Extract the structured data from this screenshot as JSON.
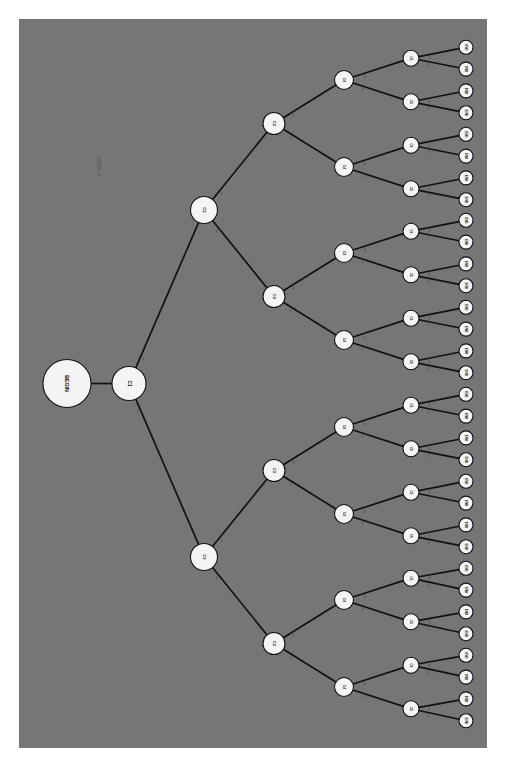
{
  "canvas": {
    "background_color": "#767676",
    "page_background_color": "#ffffff",
    "width": 468,
    "height": 729,
    "offset_x": 19,
    "offset_y": 19,
    "rotation_degrees": 90,
    "orientation_note": "all text rendered rotated 90 degrees clockwise"
  },
  "title": {
    "text": "MOD: A",
    "x": 80,
    "y": 148,
    "font_size": 5.5,
    "color": "#5e5e5e"
  },
  "style": {
    "node_fill": "#f4f4f4",
    "node_stroke": "#111111",
    "edge_stroke": "#121212",
    "label_color": "#111111",
    "edge_label_color": "#1a1a1a"
  },
  "graph": {
    "type": "binary-decision-tree",
    "root_label": "BEGIN",
    "leaf_label": "END",
    "depth_labels": [
      "BEGIN",
      "C1",
      "C2",
      "C3",
      "C4",
      "C5",
      "END"
    ],
    "leaf_count": 32,
    "edge_labels": [
      "Yes",
      "No"
    ],
    "level_radii": [
      24,
      17,
      13.5,
      11,
      9.5,
      8,
      7
    ],
    "level_font_sizes": [
      5.2,
      4.6,
      4.2,
      3.8,
      3.5,
      3.2,
      3.0
    ],
    "level_x": [
      48,
      110,
      185,
      255,
      325,
      392,
      447
    ],
    "edge_label_font_size": 2.4
  },
  "nodes": [
    {
      "id": "n0",
      "label": "BEGIN",
      "level": 0,
      "x": 48,
      "y": 364.5
    },
    {
      "id": "c1",
      "label": "C1",
      "level": 1,
      "x": 110,
      "y": 364.5
    },
    {
      "id": "c2a",
      "label": "C2",
      "level": 2,
      "x": 185,
      "y": 191.0
    },
    {
      "id": "c2b",
      "label": "C2",
      "level": 2,
      "x": 185,
      "y": 538.0
    },
    {
      "id": "c3a",
      "label": "C3",
      "level": 3,
      "x": 255,
      "y": 104.5
    },
    {
      "id": "c3b",
      "label": "C3",
      "level": 3,
      "x": 255,
      "y": 277.5
    },
    {
      "id": "c3c",
      "label": "C3",
      "level": 3,
      "x": 255,
      "y": 451.5
    },
    {
      "id": "c3d",
      "label": "C3",
      "level": 3,
      "x": 255,
      "y": 624.5
    },
    {
      "id": "c4a",
      "label": "C4",
      "level": 4,
      "x": 325,
      "y": 61.0
    },
    {
      "id": "c4b",
      "label": "C4",
      "level": 4,
      "x": 325,
      "y": 148.0
    },
    {
      "id": "c4c",
      "label": "C4",
      "level": 4,
      "x": 325,
      "y": 234.0
    },
    {
      "id": "c4d",
      "label": "C4",
      "level": 4,
      "x": 325,
      "y": 321.0
    },
    {
      "id": "c4e",
      "label": "C4",
      "level": 4,
      "x": 325,
      "y": 408.0
    },
    {
      "id": "c4f",
      "label": "C4",
      "level": 4,
      "x": 325,
      "y": 495.0
    },
    {
      "id": "c4g",
      "label": "C4",
      "level": 4,
      "x": 325,
      "y": 581.0
    },
    {
      "id": "c4h",
      "label": "C4",
      "level": 4,
      "x": 325,
      "y": 668.0
    },
    {
      "id": "c5a",
      "label": "C5",
      "level": 5,
      "x": 392,
      "y": 39.2
    },
    {
      "id": "c5b",
      "label": "C5",
      "level": 5,
      "x": 392,
      "y": 82.8
    },
    {
      "id": "c5c",
      "label": "C5",
      "level": 5,
      "x": 392,
      "y": 126.2
    },
    {
      "id": "c5d",
      "label": "C5",
      "level": 5,
      "x": 392,
      "y": 169.8
    },
    {
      "id": "c5e",
      "label": "C5",
      "level": 5,
      "x": 392,
      "y": 212.2
    },
    {
      "id": "c5f",
      "label": "C5",
      "level": 5,
      "x": 392,
      "y": 255.8
    },
    {
      "id": "c5g",
      "label": "C5",
      "level": 5,
      "x": 392,
      "y": 299.2
    },
    {
      "id": "c5h",
      "label": "C5",
      "level": 5,
      "x": 392,
      "y": 342.8
    },
    {
      "id": "c5i",
      "label": "C5",
      "level": 5,
      "x": 392,
      "y": 386.2
    },
    {
      "id": "c5j",
      "label": "C5",
      "level": 5,
      "x": 392,
      "y": 429.8
    },
    {
      "id": "c5k",
      "label": "C5",
      "level": 5,
      "x": 392,
      "y": 473.2
    },
    {
      "id": "c5l",
      "label": "C5",
      "level": 5,
      "x": 392,
      "y": 516.8
    },
    {
      "id": "c5m",
      "label": "C5",
      "level": 5,
      "x": 392,
      "y": 559.2
    },
    {
      "id": "c5n",
      "label": "C5",
      "level": 5,
      "x": 392,
      "y": 602.8
    },
    {
      "id": "c5o",
      "label": "C5",
      "level": 5,
      "x": 392,
      "y": 646.2
    },
    {
      "id": "c5p",
      "label": "C5",
      "level": 5,
      "x": 392,
      "y": 689.8
    },
    {
      "id": "e01",
      "label": "END",
      "level": 6,
      "x": 447,
      "y": 28.3
    },
    {
      "id": "e02",
      "label": "END",
      "level": 6,
      "x": 447,
      "y": 50.1
    },
    {
      "id": "e03",
      "label": "END",
      "level": 6,
      "x": 447,
      "y": 71.9
    },
    {
      "id": "e04",
      "label": "END",
      "level": 6,
      "x": 447,
      "y": 93.7
    },
    {
      "id": "e05",
      "label": "END",
      "level": 6,
      "x": 447,
      "y": 115.3
    },
    {
      "id": "e06",
      "label": "END",
      "level": 6,
      "x": 447,
      "y": 137.1
    },
    {
      "id": "e07",
      "label": "END",
      "level": 6,
      "x": 447,
      "y": 158.9
    },
    {
      "id": "e08",
      "label": "END",
      "level": 6,
      "x": 447,
      "y": 180.7
    },
    {
      "id": "e09",
      "label": "END",
      "level": 6,
      "x": 447,
      "y": 201.3
    },
    {
      "id": "e10",
      "label": "END",
      "level": 6,
      "x": 447,
      "y": 223.1
    },
    {
      "id": "e11",
      "label": "END",
      "level": 6,
      "x": 447,
      "y": 244.9
    },
    {
      "id": "e12",
      "label": "END",
      "level": 6,
      "x": 447,
      "y": 266.7
    },
    {
      "id": "e13",
      "label": "END",
      "level": 6,
      "x": 447,
      "y": 288.3
    },
    {
      "id": "e14",
      "label": "END",
      "level": 6,
      "x": 447,
      "y": 310.1
    },
    {
      "id": "e15",
      "label": "END",
      "level": 6,
      "x": 447,
      "y": 331.9
    },
    {
      "id": "e16",
      "label": "END",
      "level": 6,
      "x": 447,
      "y": 353.7
    },
    {
      "id": "e17",
      "label": "END",
      "level": 6,
      "x": 447,
      "y": 375.3
    },
    {
      "id": "e18",
      "label": "END",
      "level": 6,
      "x": 447,
      "y": 397.1
    },
    {
      "id": "e19",
      "label": "END",
      "level": 6,
      "x": 447,
      "y": 418.9
    },
    {
      "id": "e20",
      "label": "END",
      "level": 6,
      "x": 447,
      "y": 440.7
    },
    {
      "id": "e21",
      "label": "END",
      "level": 6,
      "x": 447,
      "y": 462.3
    },
    {
      "id": "e22",
      "label": "END",
      "level": 6,
      "x": 447,
      "y": 484.1
    },
    {
      "id": "e23",
      "label": "END",
      "level": 6,
      "x": 447,
      "y": 505.9
    },
    {
      "id": "e24",
      "label": "END",
      "level": 6,
      "x": 447,
      "y": 527.7
    },
    {
      "id": "e25",
      "label": "END",
      "level": 6,
      "x": 447,
      "y": 549.3
    },
    {
      "id": "e26",
      "label": "END",
      "level": 6,
      "x": 447,
      "y": 571.1
    },
    {
      "id": "e27",
      "label": "END",
      "level": 6,
      "x": 447,
      "y": 592.9
    },
    {
      "id": "e28",
      "label": "END",
      "level": 6,
      "x": 447,
      "y": 614.7
    },
    {
      "id": "e29",
      "label": "END",
      "level": 6,
      "x": 447,
      "y": 636.3
    },
    {
      "id": "e30",
      "label": "END",
      "level": 6,
      "x": 447,
      "y": 658.1
    },
    {
      "id": "e31",
      "label": "END",
      "level": 6,
      "x": 447,
      "y": 679.9
    },
    {
      "id": "e32",
      "label": "END",
      "level": 6,
      "x": 447,
      "y": 701.7
    }
  ],
  "edges": [
    {
      "from": "n0",
      "to": "c1",
      "label": ""
    },
    {
      "from": "c1",
      "to": "c2a",
      "label": "Yes"
    },
    {
      "from": "c1",
      "to": "c2b",
      "label": "No"
    },
    {
      "from": "c2a",
      "to": "c3a",
      "label": "Yes"
    },
    {
      "from": "c2a",
      "to": "c3b",
      "label": "No"
    },
    {
      "from": "c2b",
      "to": "c3c",
      "label": "Yes"
    },
    {
      "from": "c2b",
      "to": "c3d",
      "label": "No"
    },
    {
      "from": "c3a",
      "to": "c4a",
      "label": "Yes"
    },
    {
      "from": "c3a",
      "to": "c4b",
      "label": "No"
    },
    {
      "from": "c3b",
      "to": "c4c",
      "label": "Yes"
    },
    {
      "from": "c3b",
      "to": "c4d",
      "label": "No"
    },
    {
      "from": "c3c",
      "to": "c4e",
      "label": "Yes"
    },
    {
      "from": "c3c",
      "to": "c4f",
      "label": "No"
    },
    {
      "from": "c3d",
      "to": "c4g",
      "label": "Yes"
    },
    {
      "from": "c3d",
      "to": "c4h",
      "label": "No"
    },
    {
      "from": "c4a",
      "to": "c5a",
      "label": "Yes"
    },
    {
      "from": "c4a",
      "to": "c5b",
      "label": "No"
    },
    {
      "from": "c4b",
      "to": "c5c",
      "label": "Yes"
    },
    {
      "from": "c4b",
      "to": "c5d",
      "label": "No"
    },
    {
      "from": "c4c",
      "to": "c5e",
      "label": "Yes"
    },
    {
      "from": "c4c",
      "to": "c5f",
      "label": "No"
    },
    {
      "from": "c4d",
      "to": "c5g",
      "label": "Yes"
    },
    {
      "from": "c4d",
      "to": "c5h",
      "label": "No"
    },
    {
      "from": "c4e",
      "to": "c5i",
      "label": "Yes"
    },
    {
      "from": "c4e",
      "to": "c5j",
      "label": "No"
    },
    {
      "from": "c4f",
      "to": "c5k",
      "label": "Yes"
    },
    {
      "from": "c4f",
      "to": "c5l",
      "label": "No"
    },
    {
      "from": "c4g",
      "to": "c5m",
      "label": "Yes"
    },
    {
      "from": "c4g",
      "to": "c5n",
      "label": "No"
    },
    {
      "from": "c4h",
      "to": "c5o",
      "label": "Yes"
    },
    {
      "from": "c4h",
      "to": "c5p",
      "label": "No"
    },
    {
      "from": "c5a",
      "to": "e01",
      "label": "Yes"
    },
    {
      "from": "c5a",
      "to": "e02",
      "label": "No"
    },
    {
      "from": "c5b",
      "to": "e03",
      "label": "Yes"
    },
    {
      "from": "c5b",
      "to": "e04",
      "label": "No"
    },
    {
      "from": "c5c",
      "to": "e05",
      "label": "Yes"
    },
    {
      "from": "c5c",
      "to": "e06",
      "label": "No"
    },
    {
      "from": "c5d",
      "to": "e07",
      "label": "Yes"
    },
    {
      "from": "c5d",
      "to": "e08",
      "label": "No"
    },
    {
      "from": "c5e",
      "to": "e09",
      "label": "Yes"
    },
    {
      "from": "c5e",
      "to": "e10",
      "label": "No"
    },
    {
      "from": "c5f",
      "to": "e11",
      "label": "Yes"
    },
    {
      "from": "c5f",
      "to": "e12",
      "label": "No"
    },
    {
      "from": "c5g",
      "to": "e13",
      "label": "Yes"
    },
    {
      "from": "c5g",
      "to": "e14",
      "label": "No"
    },
    {
      "from": "c5h",
      "to": "e15",
      "label": "Yes"
    },
    {
      "from": "c5h",
      "to": "e16",
      "label": "No"
    },
    {
      "from": "c5i",
      "to": "e17",
      "label": "Yes"
    },
    {
      "from": "c5i",
      "to": "e18",
      "label": "No"
    },
    {
      "from": "c5j",
      "to": "e19",
      "label": "Yes"
    },
    {
      "from": "c5j",
      "to": "e20",
      "label": "No"
    },
    {
      "from": "c5k",
      "to": "e21",
      "label": "Yes"
    },
    {
      "from": "c5k",
      "to": "e22",
      "label": "No"
    },
    {
      "from": "c5l",
      "to": "e23",
      "label": "Yes"
    },
    {
      "from": "c5l",
      "to": "e24",
      "label": "No"
    },
    {
      "from": "c5m",
      "to": "e25",
      "label": "Yes"
    },
    {
      "from": "c5m",
      "to": "e26",
      "label": "No"
    },
    {
      "from": "c5n",
      "to": "e27",
      "label": "Yes"
    },
    {
      "from": "c5n",
      "to": "e28",
      "label": "No"
    },
    {
      "from": "c5o",
      "to": "e29",
      "label": "Yes"
    },
    {
      "from": "c5o",
      "to": "e30",
      "label": "No"
    },
    {
      "from": "c5p",
      "to": "e31",
      "label": "Yes"
    },
    {
      "from": "c5p",
      "to": "e32",
      "label": "No"
    }
  ]
}
